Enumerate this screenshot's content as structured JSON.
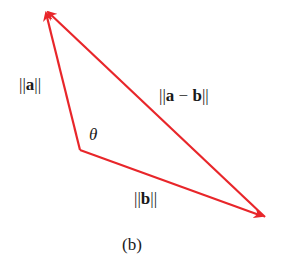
{
  "diagram": {
    "type": "vector-triangle",
    "color": "#e8262a",
    "vertices": {
      "origin": [
        80,
        150
      ],
      "a_tip": [
        45,
        10
      ],
      "b_tip": [
        265,
        217
      ]
    },
    "labels": {
      "a_norm": {
        "prefix": "||",
        "vec": "a",
        "suffix": "||"
      },
      "diff_norm": {
        "prefix": "||",
        "vec1": "a",
        "op": " − ",
        "vec2": "b",
        "suffix": "||"
      },
      "b_norm": {
        "prefix": "||",
        "vec": "b",
        "suffix": "||"
      },
      "angle": "θ",
      "caption": "(b)"
    }
  }
}
